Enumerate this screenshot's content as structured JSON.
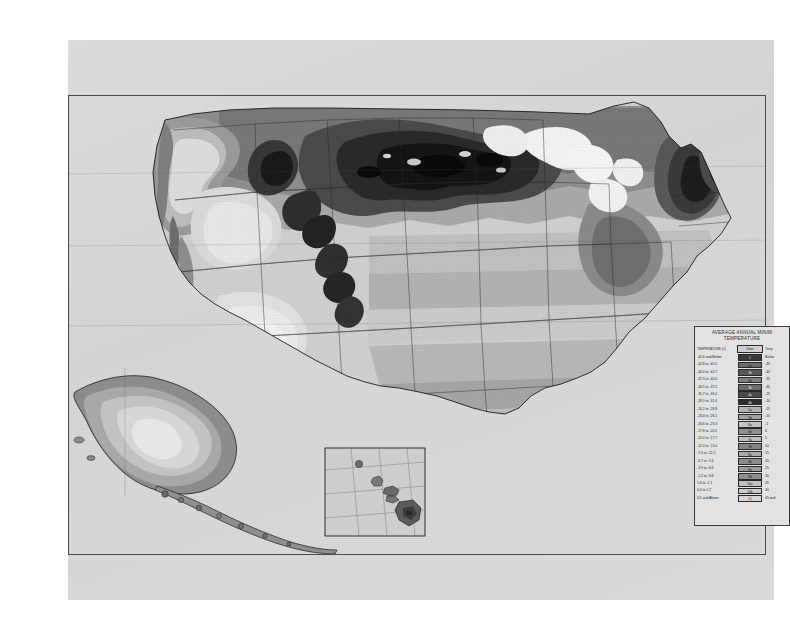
{
  "document": {
    "kind": "scanned-map-plate",
    "page_background": "#d9d9d9",
    "frame_color": "#4a4a4a"
  },
  "legend": {
    "title_line1": "AVERAGE ANNUAL MINIM",
    "title_line2": "TEMPERATURE",
    "headers": {
      "temperature": "TEMPERATURE (C)",
      "zone": "Zone",
      "temperature_f": "Temp"
    },
    "rows": [
      {
        "temp_c": "-45.6 and Below",
        "zone": "1",
        "temp_f": "Below",
        "color": "#3a3a3a"
      },
      {
        "temp_c": "-42.8 to -45.5",
        "zone": "2a",
        "temp_f": "-45",
        "color": "#6e6e6e"
      },
      {
        "temp_c": "-40.0 to -42.7",
        "zone": "2b",
        "temp_f": "-40",
        "color": "#575757"
      },
      {
        "temp_c": "-37.3 to -40.0",
        "zone": "3a",
        "temp_f": "-35",
        "color": "#7f7f7f"
      },
      {
        "temp_c": "-34.5 to -37.2",
        "zone": "3b",
        "temp_f": "-30",
        "color": "#6a6a6a"
      },
      {
        "temp_c": "-31.7 to -34.4",
        "zone": "4a",
        "temp_f": "-25",
        "color": "#4a4a4a"
      },
      {
        "temp_c": "-28.9 to -31.6",
        "zone": "4b",
        "temp_f": "-20",
        "color": "#2e2e2e"
      },
      {
        "temp_c": "-26.2 to -28.8",
        "zone": "5a",
        "temp_f": "-15",
        "color": "#b3b3b3"
      },
      {
        "temp_c": "-23.4 to -26.1",
        "zone": "5b",
        "temp_f": "-10",
        "color": "#a0a0a0"
      },
      {
        "temp_c": "-20.6 to -23.3",
        "zone": "6a",
        "temp_f": "-5",
        "color": "#c4c4c4"
      },
      {
        "temp_c": "-17.8 to -20.5",
        "zone": "6b",
        "temp_f": "0",
        "color": "#909090"
      },
      {
        "temp_c": "-15.0 to -17.7",
        "zone": "7a",
        "temp_f": "5",
        "color": "#bdbdbd"
      },
      {
        "temp_c": "-12.3 to -15.0",
        "zone": "7b",
        "temp_f": "10",
        "color": "#848484"
      },
      {
        "temp_c": "-9.5 to -12.2",
        "zone": "8a",
        "temp_f": "15",
        "color": "#ababab"
      },
      {
        "temp_c": "-6.7 to -9.4",
        "zone": "8b",
        "temp_f": "20",
        "color": "#8c8c8c"
      },
      {
        "temp_c": "-3.9 to -6.6",
        "zone": "9a",
        "temp_f": "25",
        "color": "#9b9b9b"
      },
      {
        "temp_c": "-1.2 to -3.8",
        "zone": "9b",
        "temp_f": "30",
        "color": "#8f8f8f"
      },
      {
        "temp_c": "1.6 to -1.1",
        "zone": "10a",
        "temp_f": "35",
        "color": "#bfbfbf"
      },
      {
        "temp_c": "4.4 to 1.7",
        "zone": "10b",
        "temp_f": "40",
        "color": "#cccccc"
      },
      {
        "temp_c": "4.5 and Above",
        "zone": "11",
        "temp_f": "45 and",
        "color": "#d6d6d6"
      }
    ]
  },
  "map": {
    "main_region": "Contiguous United States",
    "insets": [
      {
        "name": "Alaska"
      },
      {
        "name": "Hawaii"
      }
    ]
  }
}
